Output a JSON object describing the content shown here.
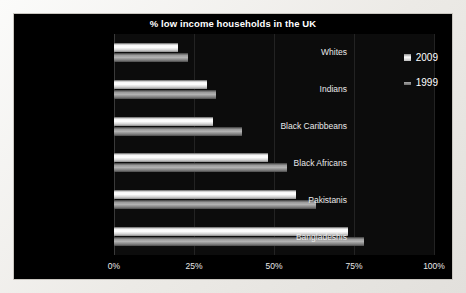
{
  "chart_data": {
    "type": "bar",
    "orientation": "horizontal",
    "title": "% low income households in the UK",
    "xlabel": "",
    "ylabel": "",
    "xlim": [
      0,
      100
    ],
    "xticks": [
      "0%",
      "25%",
      "50%",
      "75%",
      "100%"
    ],
    "xtick_values": [
      0,
      25,
      50,
      75,
      100
    ],
    "grid": true,
    "legend_position": "top-right",
    "categories": [
      "Whites",
      "Indians",
      "Black Caribbeans",
      "Black Africans",
      "Pakistanis",
      "Bangladeshis"
    ],
    "series": [
      {
        "name": "2009",
        "values": [
          20,
          29,
          31,
          48,
          57,
          73
        ]
      },
      {
        "name": "1999",
        "values": [
          23,
          32,
          40,
          54,
          63,
          78
        ]
      }
    ]
  },
  "colors": {
    "background": "#000000",
    "plot_background": "#0c0c0c",
    "text": "#ffffff",
    "gridline": "#232323",
    "series_2009": "#ffffff",
    "series_1999": "#9a9a9a"
  }
}
